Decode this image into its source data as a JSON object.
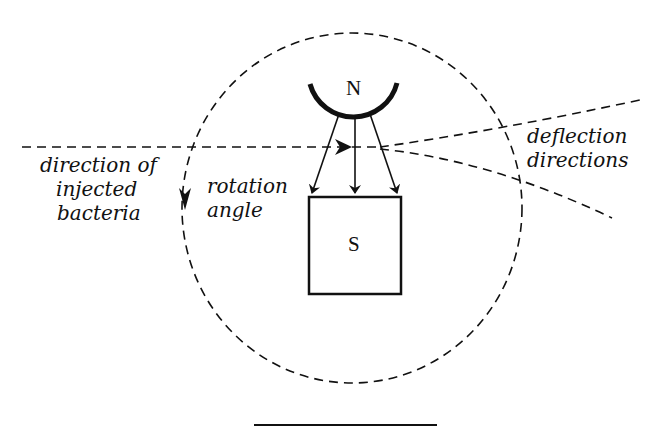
{
  "diagram": {
    "labels": {
      "north_pole": "N",
      "south_pole": "S",
      "injected_line1": "direction of",
      "injected_line2": "injected",
      "injected_line3": "bacteria",
      "rotation_line1": "rotation",
      "rotation_line2": "angle",
      "deflection_line1": "deflection",
      "deflection_line2": "directions"
    },
    "colors": {
      "stroke": "#111111",
      "background": "#ffffff"
    }
  }
}
